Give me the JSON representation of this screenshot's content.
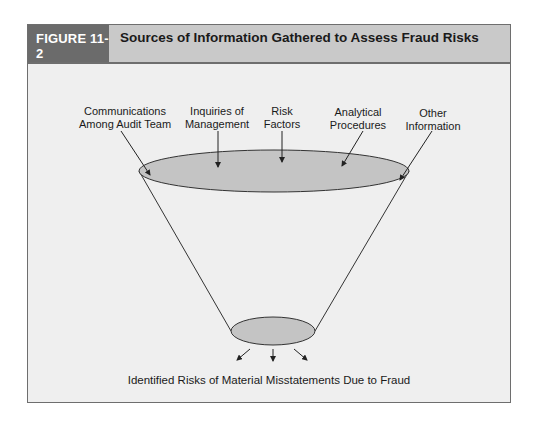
{
  "figure": {
    "number": "FIGURE 11-2",
    "title": "Sources of Information Gathered to Assess Fraud Risks"
  },
  "inputs": [
    {
      "line1": "Communications",
      "line2": "Among Audit Team"
    },
    {
      "line1": "Inquiries of",
      "line2": "Management"
    },
    {
      "line1": "Risk",
      "line2": "Factors"
    },
    {
      "line1": "Analytical",
      "line2": "Procedures"
    },
    {
      "line1": "Other",
      "line2": "Information"
    }
  ],
  "output": {
    "label": "Identified Risks of Material Misstatements Due to Fraud"
  },
  "colors": {
    "header_dark": "#6b6b6b",
    "header_light": "#c9c9c9",
    "body": "#efefef",
    "funnel_fill": "#c4c4c4",
    "line": "#333333"
  }
}
